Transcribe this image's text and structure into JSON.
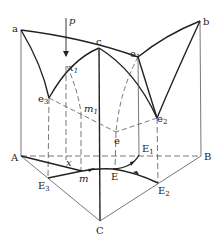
{
  "diagram": {
    "type": "ternary-eutectic-phase-diagram-3d",
    "colors": {
      "line": "#222222",
      "thin": "#555555",
      "dash": "#555555"
    },
    "labels": {
      "a": "a",
      "b": "b",
      "c": "c",
      "e": "e",
      "e1": "e",
      "e1_sub": "1",
      "e2": "e",
      "e2_sub": "2",
      "e3": "e",
      "e3_sub": "3",
      "p": "p",
      "x1": "x",
      "x1_sub": "1",
      "m1": "m",
      "m1_sub": "1",
      "A": "A",
      "B": "B",
      "C": "C",
      "E": "E",
      "E1": "E",
      "E1_sub": "1",
      "E2": "E",
      "E2_sub": "2",
      "E3": "E",
      "E3_sub": "3",
      "x": "x",
      "m": "m"
    }
  }
}
